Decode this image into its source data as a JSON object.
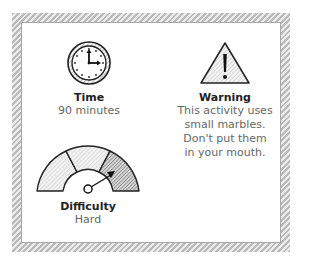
{
  "card": {
    "time": {
      "icon": "clock-icon",
      "title": "Time",
      "value": "90 minutes"
    },
    "warning": {
      "icon": "warning-triangle-icon",
      "title": "Warning",
      "lines": [
        "This activity uses",
        "small marbles.",
        "Don't put them",
        "in your mouth."
      ]
    },
    "difficulty": {
      "icon": "difficulty-gauge-icon",
      "title": "Difficulty",
      "value": "Hard",
      "levels": [
        "Easy",
        "Medium",
        "Hard"
      ],
      "selected_index": 2
    }
  },
  "colors": {
    "frame_hatch": "#b9b9b9",
    "text_title": "#222222",
    "text_value": "#666666"
  }
}
